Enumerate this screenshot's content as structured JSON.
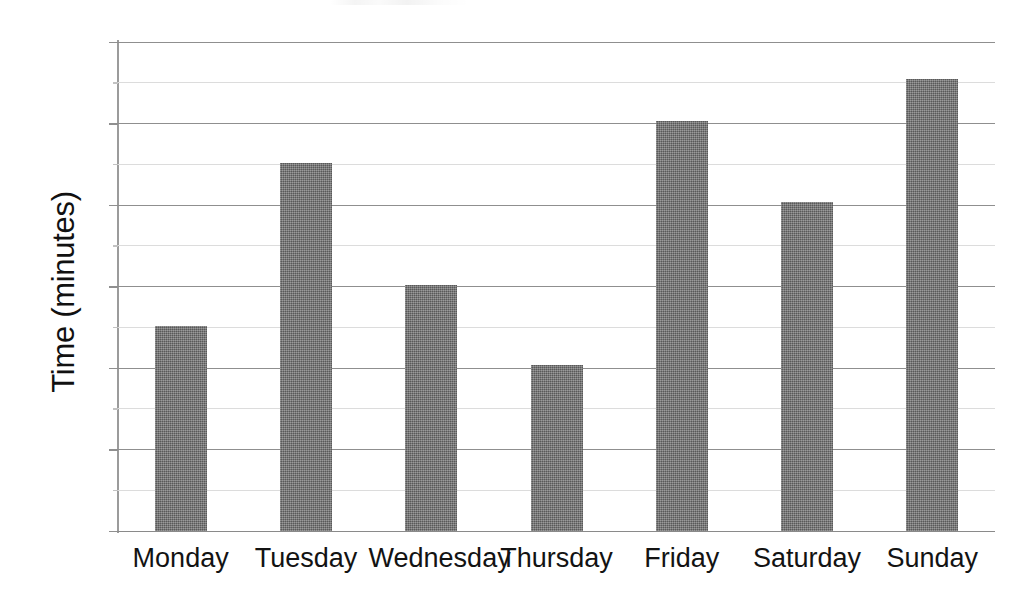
{
  "chart_data": {
    "type": "bar",
    "title": "",
    "subtitle": "",
    "xlabel": "",
    "ylabel": "Time (minutes)",
    "categories": [
      "Monday",
      "Tuesday",
      "Wednesday",
      "Thursday",
      "Friday",
      "Saturday",
      "Sunday"
    ],
    "values": [
      25.2,
      45.2,
      30.2,
      20.4,
      50.3,
      40.4,
      55.5
    ],
    "ylim": [
      0,
      60
    ],
    "ytick_labels": [
      "0",
      "10",
      "20",
      "30",
      "40",
      "50",
      "60"
    ],
    "ytick_values": [
      0,
      10,
      20,
      30,
      40,
      50,
      60
    ],
    "minor_gridline_values": [
      5,
      15,
      25,
      35,
      45,
      55
    ],
    "grid": "horizontal",
    "legend": "none",
    "series": [
      {
        "name": "Time",
        "color": "#6e6e6e",
        "values": [
          25.2,
          45.2,
          30.2,
          20.4,
          50.3,
          40.4,
          55.5
        ]
      }
    ],
    "annotations": []
  },
  "colors": {
    "bar_fill": "#6e6e6e",
    "major_gridline": "#8f8f8f",
    "minor_gridline": "#dcdcdc",
    "axis_line": "#9b9b9b",
    "text": "#131313",
    "background": "#ffffff"
  }
}
